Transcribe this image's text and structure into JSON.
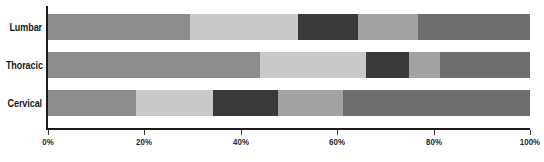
{
  "chart_data": {
    "type": "bar",
    "orientation": "horizontal",
    "stacked": true,
    "normalized": true,
    "title": "",
    "subtitle": "",
    "xlabel": "",
    "ylabel": "",
    "categories": [
      "Lumbar",
      "Thoracic",
      "Cervical"
    ],
    "series": [
      {
        "name": "Segment 1",
        "color": "#8c8c8c",
        "values": [
          29.5,
          44.0,
          18.3
        ]
      },
      {
        "name": "Segment 2",
        "color": "#c9c9c9",
        "values": [
          22.4,
          22.0,
          15.9
        ]
      },
      {
        "name": "Segment 3",
        "color": "#3a3a3a",
        "values": [
          12.4,
          8.9,
          13.5
        ]
      },
      {
        "name": "Segment 4",
        "color": "#a3a3a3",
        "values": [
          12.5,
          6.4,
          13.5
        ]
      },
      {
        "name": "Segment 5",
        "color": "#6e6e6e",
        "values": [
          23.2,
          18.7,
          38.8
        ]
      }
    ],
    "xlim": [
      0,
      100
    ],
    "xticks": [
      0,
      20,
      40,
      60,
      80,
      100
    ],
    "xtick_labels": [
      "0%",
      "20%",
      "40%",
      "60%",
      "80%",
      "100%"
    ],
    "grid": false,
    "legend": "none",
    "axis_color": "#1a1a1a",
    "background": "#ffffff"
  }
}
